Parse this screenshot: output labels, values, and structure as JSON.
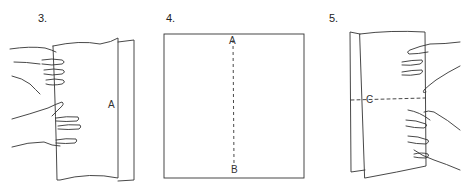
{
  "steps": [
    {
      "number": "3.",
      "labels": {
        "fold": "A"
      }
    },
    {
      "number": "4.",
      "labels": {
        "top": "A",
        "bottom": "B"
      }
    },
    {
      "number": "5.",
      "labels": {
        "fold": "C"
      }
    }
  ],
  "colors": {
    "line": "#333333",
    "background": "#ffffff"
  }
}
